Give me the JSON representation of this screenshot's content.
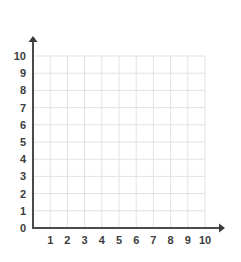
{
  "chart_data": {
    "type": "scatter",
    "title": "",
    "subtitle": "",
    "xlabel": "",
    "ylabel": "",
    "xlim": [
      0,
      10
    ],
    "ylim": [
      0,
      10
    ],
    "x_ticks": [
      1,
      2,
      3,
      4,
      5,
      6,
      7,
      8,
      9,
      10
    ],
    "y_ticks": [
      0,
      1,
      2,
      3,
      4,
      5,
      6,
      7,
      8,
      9,
      10
    ],
    "x_tick_labels": [
      "1",
      "2",
      "3",
      "4",
      "5",
      "6",
      "7",
      "8",
      "9",
      "10"
    ],
    "y_tick_labels": [
      "10",
      "9",
      "8",
      "7",
      "6",
      "5",
      "4",
      "3",
      "2",
      "1",
      "0"
    ],
    "origin_label": "0",
    "grid": true,
    "legend": null,
    "annotations": [],
    "series": [],
    "data_points": [],
    "colors": {
      "background": "#ffffff",
      "gridline": "#e2e2e2",
      "axis": "#4a4a4a",
      "label": "#3d3d3d"
    },
    "axis_arrows": {
      "x_axis": "arrow-right",
      "y_axis": "arrow-up"
    }
  },
  "geometry": {
    "origin_x": 33,
    "origin_y": 228,
    "unit": 17.2,
    "units_x": 10,
    "units_y": 10
  },
  "icons": {
    "x_axis_arrow": "arrow-right-icon",
    "y_axis_arrow": "arrow-up-icon"
  }
}
